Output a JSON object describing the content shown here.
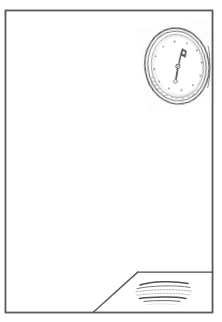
{
  "artwork": {
    "title": "Room Interior with Oval Wall Clock",
    "medium": "pen-and-ink line drawing",
    "background_color": "#ffffff",
    "ink_color": "#3a3a3a",
    "width": 222,
    "height": 322
  },
  "frame": {
    "name": "picture-border",
    "x": 5,
    "y": 10,
    "width": 208,
    "height": 303,
    "stroke_color": "#4a4a4a",
    "stroke_width": 1.6
  },
  "wall": {
    "name": "back-wall",
    "fill_color": "#ffffff",
    "description": "large blank wall surface filling most of the frame"
  },
  "clock": {
    "name": "oval-wall-clock",
    "center_x": 177,
    "center_y": 66,
    "radius_x": 32,
    "radius_y": 38,
    "rotation_deg": -8,
    "outer_ring_color": "#555555",
    "face_color": "#ffffff",
    "shading_side": "left",
    "shading_color": "#6e6e6e",
    "hour_marker_count": 12,
    "hour_marker_color": "#777777",
    "hands": {
      "minute_hand_direction": "up-right",
      "minute_hand_angle_deg": 25,
      "hour_hand_direction": "down-left",
      "hour_hand_angle_deg": 200,
      "hand_color": "#3b3b3b",
      "style": "ornate kite-and-tail"
    }
  },
  "floor": {
    "name": "floor-corner",
    "description": "angled floor plane in lower right corner",
    "diagonal_start_x": 93,
    "diagonal_start_y": 313,
    "diagonal_end_x": 137,
    "diagonal_end_y": 272,
    "horizon_y": 272,
    "stroke_color": "#4a4a4a"
  },
  "rug": {
    "name": "floor-rug",
    "center_x": 163,
    "center_y": 293,
    "width": 58,
    "height": 22,
    "line_count": 6,
    "stroke_color": "#5a5a5a",
    "description": "small oval mat rendered with stacked horizontal squiggle strokes"
  },
  "labels": {
    "scene_caption": ""
  }
}
